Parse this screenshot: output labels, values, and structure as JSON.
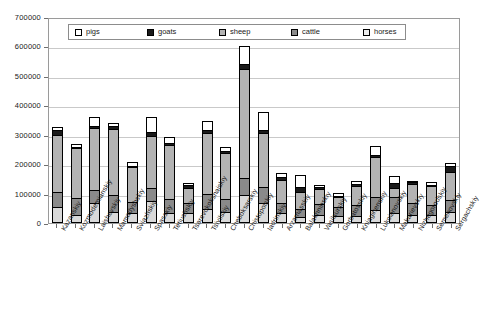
{
  "chart_data": {
    "type": "bar",
    "subtype": "stacked-column",
    "title": "",
    "xlabel": "",
    "ylabel": "",
    "ylim": [
      0,
      700000
    ],
    "ytick_step": 100000,
    "ytick_labels": [
      "0",
      "100000",
      "200000",
      "300000",
      "400000",
      "500000",
      "600000",
      "700000"
    ],
    "grid": true,
    "legend_position": "top-center",
    "stack_order_bottom_to_top": [
      "horses",
      "cattle",
      "sheep",
      "goats",
      "pigs"
    ],
    "categories": [
      "Kazanskiy",
      "Kozmodemianskiy",
      "Laishevskiy",
      "Mamadyshskiy",
      "Sviazhskiy",
      "Spasskiy",
      "Tetiushskiy",
      "Tsarevokokshaiskiy",
      "Tsivilskiy",
      "Cheboksarskiy",
      "Chistopolskiy",
      "Iadrinskiy",
      "Arzamasskiy",
      "Balakhninskiy",
      "Vasilsurskiy",
      "Gorbatovskiy",
      "Kniaginenskiy",
      "Lukoianovskiy",
      "Makarievskiy",
      "Nizhegorodskiy",
      "Semenovskiy",
      "Sergachskiy"
    ],
    "series": [
      {
        "name": "horses",
        "color": "#d9d9d9",
        "values": [
          48000,
          22000,
          62000,
          30000,
          26000,
          68000,
          28000,
          28000,
          40000,
          30000,
          88000,
          62000,
          26000,
          12000,
          22000,
          16000,
          18000,
          36000,
          26000,
          22000,
          20000,
          30000
        ]
      },
      {
        "name": "cattle",
        "color": "#8a8a8a",
        "values": [
          50000,
          56000,
          42000,
          60000,
          40000,
          44000,
          48000,
          32000,
          52000,
          44000,
          58000,
          52000,
          34000,
          30000,
          36000,
          30000,
          36000,
          46000,
          54000,
          40000,
          34000,
          40000
        ]
      },
      {
        "name": "sheep",
        "color": "#b3b3b3",
        "values": [
          196000,
          170000,
          212000,
          222000,
          118000,
          178000,
          182000,
          52000,
          206000,
          156000,
          372000,
          186000,
          80000,
          56000,
          52000,
          34000,
          66000,
          136000,
          32000,
          64000,
          66000,
          96000
        ]
      },
      {
        "name": "goats",
        "color": "#1a1a1a",
        "values": [
          14000,
          2000,
          8000,
          10000,
          4000,
          14000,
          8000,
          10000,
          12000,
          8000,
          14000,
          8000,
          10000,
          16000,
          4000,
          2000,
          6000,
          8000,
          16000,
          6000,
          4000,
          20000
        ]
      },
      {
        "name": "pigs",
        "color": "#ffffff",
        "values": [
          10000,
          12000,
          28000,
          10000,
          14000,
          50000,
          18000,
          6000,
          30000,
          14000,
          62000,
          64000,
          14000,
          42000,
          10000,
          12000,
          10000,
          28000,
          26000,
          4000,
          8000,
          12000
        ]
      }
    ]
  },
  "legend": {
    "items": [
      {
        "label": "pigs",
        "swatch": "legend-swatch-pigs",
        "color": "#ffffff"
      },
      {
        "label": "goats",
        "swatch": "legend-swatch-goats",
        "color": "#1a1a1a"
      },
      {
        "label": "sheep",
        "swatch": "legend-swatch-sheep",
        "color": "#b3b3b3"
      },
      {
        "label": "cattle",
        "swatch": "legend-swatch-cattle",
        "color": "#8a8a8a"
      },
      {
        "label": "horses",
        "swatch": "legend-swatch-horses",
        "color": "#eeeeee"
      }
    ]
  },
  "axes": {
    "y_max": 700000,
    "y_min": 0,
    "tick_color": "#6f6f6f",
    "grid_color": "#c9c9c9",
    "frame_color": "#9a9a9a"
  }
}
